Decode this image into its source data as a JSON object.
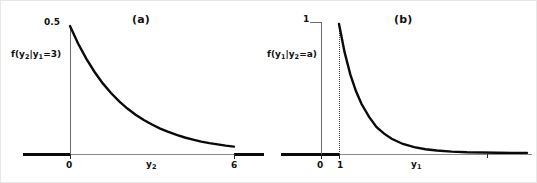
{
  "figure": {
    "background_color": "#ffffff",
    "curve_color": "#0a0a0a",
    "axis_color": "#8a8a8a",
    "axis_bold_color": "#0a0a0a",
    "text_color": "#111111"
  },
  "panels": [
    {
      "id": "a",
      "title": "(a)",
      "ylabel_text": "f(y",
      "ylabel_sub1": "2",
      "ylabel_mid": "|y",
      "ylabel_sub2": "1",
      "ylabel_end": "=3)",
      "xlabel_text": "y",
      "xlabel_sub": "2",
      "ytick": "0.5",
      "xticks": [
        "0",
        "6"
      ]
    },
    {
      "id": "b",
      "title": "(b)",
      "ylabel_text": "f(y",
      "ylabel_sub1": "1",
      "ylabel_mid": "|y",
      "ylabel_sub2": "2",
      "ylabel_end": "=a)",
      "xlabel_text": "y",
      "xlabel_sub": "1",
      "ytick": "1",
      "xticks": [
        "0",
        "1"
      ]
    }
  ],
  "chart_data": [
    {
      "type": "line",
      "title": "(a)",
      "xlabel": "y_2",
      "ylabel": "f(y_2|y_1=3)",
      "xlim": [
        0,
        6.6
      ],
      "ylim": [
        0,
        0.5
      ],
      "xticks": [
        0,
        6
      ],
      "xticklabels": [
        "0",
        "6"
      ],
      "yticks": [
        0.5
      ],
      "yticklabels": [
        "0.5"
      ],
      "grid": false,
      "legend": "none",
      "description": "Exponential density decaying from 0.5 at y2=0 toward 0 at y2=6",
      "x": [
        0,
        0.3,
        0.6,
        0.9,
        1.2,
        1.5,
        1.8,
        2.1,
        2.4,
        2.7,
        3.0,
        3.3,
        3.6,
        3.9,
        4.2,
        4.5,
        4.8,
        5.1,
        5.4,
        5.7,
        6.0
      ],
      "y": [
        0.5,
        0.43,
        0.371,
        0.319,
        0.274,
        0.236,
        0.203,
        0.175,
        0.151,
        0.13,
        0.112,
        0.096,
        0.083,
        0.071,
        0.061,
        0.053,
        0.045,
        0.039,
        0.034,
        0.029,
        0.025
      ]
    },
    {
      "type": "line",
      "title": "(b)",
      "xlabel": "y_1",
      "ylabel": "f(y_1|y_2=a)",
      "xlim": [
        0,
        6.2
      ],
      "ylim": [
        0,
        1
      ],
      "xticks": [
        0,
        1
      ],
      "xticklabels": [
        "0",
        "1"
      ],
      "yticks": [
        1
      ],
      "yticklabels": [
        "1"
      ],
      "grid": false,
      "legend": "none",
      "annotations": [
        "vertical dotted line at y1=1 from axis up to curve peak"
      ],
      "description": "Truncated exponential density starting at height 1 at y1=1 and decaying toward 0",
      "x": [
        1.0,
        1.15,
        1.3,
        1.45,
        1.6,
        1.8,
        2.0,
        2.2,
        2.4,
        2.7,
        3.0,
        3.3,
        3.6,
        4.0,
        4.4,
        4.8,
        5.2,
        5.6,
        6.0
      ],
      "y": [
        1.0,
        0.78,
        0.61,
        0.48,
        0.38,
        0.28,
        0.2,
        0.15,
        0.11,
        0.07,
        0.045,
        0.029,
        0.019,
        0.011,
        0.006,
        0.004,
        0.002,
        0.001,
        0.001
      ]
    }
  ]
}
